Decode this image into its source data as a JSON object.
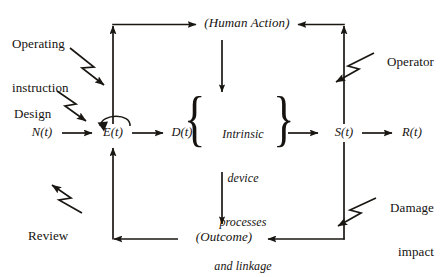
{
  "diagram": {
    "background_color": "#ffffff",
    "line_color": "#1a1713",
    "nodes": {
      "n_t": "N(t)",
      "e_t": "E(t)",
      "d_t": "D(t)",
      "s_t": "S(t)",
      "r_t": "R(t)",
      "human_action": "(Human Action)",
      "outcome": "(Outcome)"
    },
    "center_block": {
      "line1": "Intrinsic",
      "line2": "device",
      "line3": "processes",
      "line4": "and linkage",
      "brace_left": "{",
      "brace_right": "}"
    },
    "external_inputs": [
      {
        "id": "operating-instruction",
        "line1": "Operating",
        "line2": "instruction"
      },
      {
        "id": "design",
        "line1": "Design",
        "line2": ""
      },
      {
        "id": "review",
        "line1": "Review",
        "line2": ""
      },
      {
        "id": "operator",
        "line1": "Operator",
        "line2": ""
      },
      {
        "id": "damage-impact",
        "line1": "Damage",
        "line2": "impact"
      }
    ]
  }
}
